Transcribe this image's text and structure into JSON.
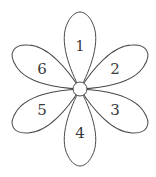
{
  "diagram": {
    "type": "flower",
    "center": {
      "x": 80,
      "y": 89,
      "r": 7
    },
    "stroke_color": "#4a4a4a",
    "fill_color": "#ffffff",
    "petals": [
      {
        "label": "1",
        "angle": 0,
        "label_x": 80,
        "label_y": 46
      },
      {
        "label": "2",
        "angle": 60,
        "label_x": 115,
        "label_y": 69
      },
      {
        "label": "3",
        "angle": 120,
        "label_x": 115,
        "label_y": 110
      },
      {
        "label": "4",
        "angle": 180,
        "label_x": 80,
        "label_y": 133
      },
      {
        "label": "5",
        "angle": 240,
        "label_x": 42,
        "label_y": 110
      },
      {
        "label": "6",
        "angle": 300,
        "label_x": 42,
        "label_y": 69
      }
    ]
  }
}
